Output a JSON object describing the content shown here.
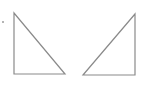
{
  "figure": {
    "background": "#ffffff",
    "stroke_color": "#8a8a8a",
    "marker": {
      "x": 3,
      "y": 22,
      "r": 0.8
    },
    "shapes": [
      {
        "name": "left-right-triangle",
        "points": "14,13 14,74 65,74"
      },
      {
        "name": "right-right-triangle",
        "points": "135,14 135,75 83,75"
      }
    ]
  }
}
